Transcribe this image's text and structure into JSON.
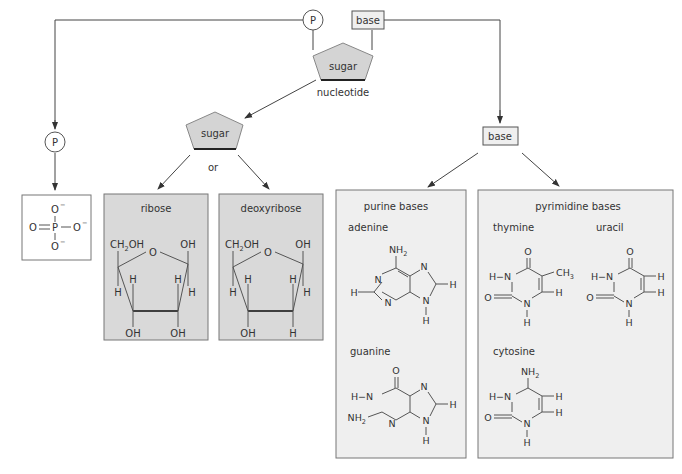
{
  "top": {
    "phosphate_label": "P",
    "base_label": "base",
    "sugar_label": "sugar",
    "nucleotide_label": "nucleotide"
  },
  "phosphate_branch": {
    "phosphate_label": "P",
    "formula": {
      "center": "P",
      "top": "O",
      "left": "O",
      "right": "O",
      "bottom": "O",
      "charge": "−"
    }
  },
  "sugar_branch": {
    "sugar_label": "sugar",
    "or_label": "or",
    "ribose": {
      "title": "ribose",
      "ch2oh": "CH",
      "ch2oh_sub": "2",
      "ch2oh_tail": "OH",
      "ring_o": "O",
      "top_right": "OH",
      "h_left_outer": "H",
      "h_left_inner": "H",
      "h_right_inner": "H",
      "h_right_outer": "H",
      "bottom_left": "OH",
      "bottom_right": "OH"
    },
    "deoxyribose": {
      "title": "deoxyribose",
      "ch2oh": "CH",
      "ch2oh_sub": "2",
      "ch2oh_tail": "OH",
      "ring_o": "O",
      "top_right": "OH",
      "h_left_outer": "H",
      "h_left_inner": "H",
      "h_right_inner": "H",
      "h_right_outer": "H",
      "bottom_left": "OH",
      "bottom_right": "H"
    }
  },
  "base_branch": {
    "base_label": "base",
    "purine": {
      "title": "purine bases",
      "adenine": {
        "name": "adenine",
        "nh2": "NH",
        "sub2": "2",
        "n": "N",
        "h": "H"
      },
      "guanine": {
        "name": "guanine",
        "o": "O",
        "hn": "H−N",
        "nh2": "NH",
        "sub2": "2",
        "n": "N",
        "h": "H"
      }
    },
    "pyrimidine": {
      "title": "pyrimidine bases",
      "thymine": {
        "name": "thymine",
        "o": "O",
        "hn": "H−N",
        "ch3": "CH",
        "sub3": "3",
        "n": "N",
        "h": "H"
      },
      "uracil": {
        "name": "uracil",
        "o": "O",
        "hn": "H−N",
        "n": "N",
        "h": "H"
      },
      "cytosine": {
        "name": "cytosine",
        "nh2": "NH",
        "sub2": "2",
        "hn": "H−N",
        "o": "O",
        "n": "N",
        "h": "H"
      }
    }
  },
  "colors": {
    "box_dark": "#d9d9d9",
    "box_light": "#efefef",
    "pentagon_fill": "#d4d4d4",
    "line": "#444444"
  }
}
